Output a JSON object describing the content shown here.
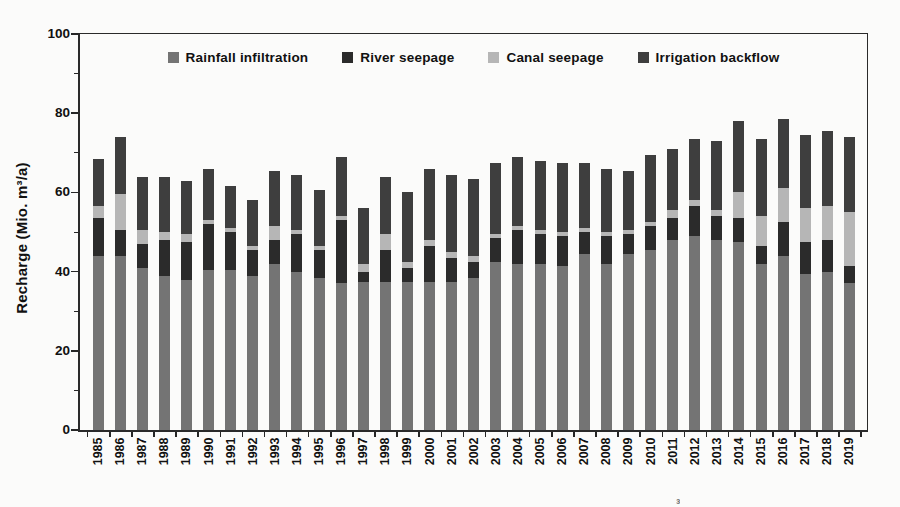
{
  "figure": {
    "background": "#fbfbfa",
    "axis_color": "#262626",
    "caption_fragment": "³"
  },
  "chart_data": {
    "type": "bar",
    "stacked": true,
    "title": "",
    "xlabel": "",
    "ylabel": "Recharge (Mio. m³/a)",
    "ylim": [
      0,
      100
    ],
    "yticks": [
      0,
      20,
      40,
      60,
      80,
      100
    ],
    "yticks_minor": [
      10,
      30,
      50,
      70,
      90
    ],
    "grid": false,
    "legend_position": "top-center",
    "categories": [
      1985,
      1986,
      1987,
      1988,
      1989,
      1990,
      1991,
      1992,
      1993,
      1994,
      1995,
      1996,
      1997,
      1998,
      1999,
      2000,
      2001,
      2002,
      2003,
      2004,
      2005,
      2006,
      2007,
      2008,
      2009,
      2010,
      2011,
      2012,
      2013,
      2014,
      2015,
      2016,
      2017,
      2018,
      2019
    ],
    "series": [
      {
        "name": "Rainfall infiltration",
        "color": "#747474",
        "values": [
          44,
          44,
          41,
          39,
          38,
          40.5,
          40.5,
          39,
          42,
          40,
          38.5,
          37,
          37.5,
          37.5,
          37.5,
          37.5,
          37.5,
          38.5,
          42.5,
          42,
          42,
          41.5,
          44.5,
          42,
          44.5,
          45.5,
          48,
          49,
          48,
          47.5,
          42,
          44,
          39.5,
          40,
          37
        ]
      },
      {
        "name": "River seepage",
        "color": "#2b2b2b",
        "values": [
          9.5,
          6.5,
          6,
          9,
          9.5,
          11.5,
          9.5,
          6.5,
          6,
          9.5,
          7,
          16,
          2.5,
          8,
          3.5,
          9,
          6,
          4,
          6,
          8.5,
          7.5,
          7.5,
          5.5,
          7,
          5,
          6,
          5.5,
          7.5,
          6,
          6,
          4.5,
          8.5,
          8,
          8,
          4.5
        ]
      },
      {
        "name": "Canal seepage",
        "color": "#b6b6b6",
        "values": [
          3,
          9,
          3.5,
          2,
          2,
          1,
          1,
          1,
          3.5,
          1,
          1,
          1,
          2,
          4,
          1.5,
          1.5,
          1.5,
          1.5,
          1,
          1,
          1,
          1,
          1,
          1,
          1,
          1,
          2,
          1.5,
          1.5,
          6.5,
          7.5,
          8.5,
          8.5,
          8.5,
          13.5
        ]
      },
      {
        "name": "Irrigation backflow",
        "color": "#3e3e3e",
        "values": [
          12,
          14.5,
          13.5,
          14,
          13.5,
          13,
          10.5,
          11.5,
          14,
          14,
          14,
          15,
          14,
          14.5,
          17.5,
          18,
          19.5,
          19.5,
          18,
          17.5,
          17.5,
          17.5,
          16.5,
          16,
          15,
          17,
          15.5,
          15.5,
          17.5,
          18,
          19.5,
          17.5,
          18.5,
          19,
          19
        ]
      }
    ],
    "totals": [
      68.5,
      74,
      64,
      64,
      63,
      66,
      61.5,
      58,
      65.5,
      64.5,
      60.5,
      69,
      56,
      64,
      60,
      66,
      64.5,
      63.5,
      67.5,
      69,
      68,
      67.5,
      67.5,
      66,
      65.5,
      69.5,
      71,
      73.5,
      73,
      78,
      73.5,
      78.5,
      74.5,
      75.5,
      74
    ]
  }
}
